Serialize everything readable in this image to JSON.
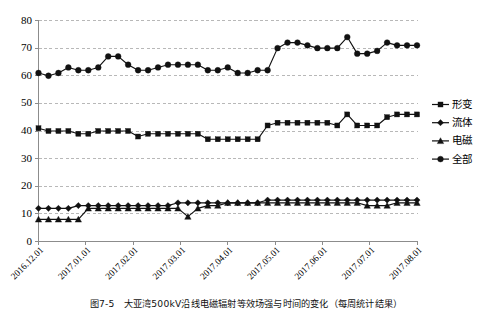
{
  "chart_data": {
    "type": "line",
    "title": "",
    "xlabel": "",
    "ylabel": "",
    "ylim": [
      0,
      80
    ],
    "ytick_step": 10,
    "yticks": [
      0,
      10,
      20,
      30,
      40,
      50,
      60,
      70,
      80
    ],
    "grid": true,
    "legend_position": "right",
    "x_tick_labels": [
      "2016.12.01",
      "2017.01.01",
      "2017.02.01",
      "2017.03.01",
      "2017.04.01",
      "2017.05.01",
      "2017.06.01",
      "2017.07.01",
      "2017.08.01"
    ],
    "n_points": 39,
    "series": [
      {
        "name": "形变",
        "marker": "square",
        "values": [
          41,
          40,
          40,
          40,
          39,
          39,
          40,
          40,
          40,
          40,
          38,
          39,
          39,
          39,
          39,
          39,
          39,
          37,
          37,
          37,
          37,
          37,
          37,
          42,
          43,
          43,
          43,
          43,
          43,
          43,
          42,
          46,
          42,
          42,
          42,
          45,
          46,
          46,
          46
        ]
      },
      {
        "name": "流体",
        "marker": "diamond",
        "values": [
          12,
          12,
          12,
          12,
          13,
          13,
          13,
          13,
          13,
          13,
          13,
          13,
          13,
          13,
          14,
          14,
          14,
          14,
          14,
          14,
          14,
          14,
          14,
          15,
          15,
          15,
          15,
          15,
          15,
          15,
          15,
          15,
          15,
          15,
          15,
          15,
          15,
          15,
          15
        ]
      },
      {
        "name": "电磁",
        "marker": "triangle",
        "values": [
          8,
          8,
          8,
          8,
          8,
          12,
          12,
          12,
          12,
          12,
          12,
          12,
          12,
          12,
          12,
          9,
          12,
          13,
          13,
          14,
          14,
          14,
          14,
          14,
          14,
          14,
          14,
          14,
          14,
          14,
          14,
          14,
          14,
          13,
          13,
          13,
          14,
          14,
          14
        ]
      },
      {
        "name": "全部",
        "marker": "circle",
        "values": [
          61,
          60,
          61,
          63,
          62,
          62,
          63,
          67,
          67,
          64,
          62,
          62,
          63,
          64,
          64,
          64,
          64,
          62,
          62,
          63,
          61,
          61,
          62,
          62,
          70,
          72,
          72,
          71,
          70,
          70,
          70,
          74,
          68,
          68,
          69,
          72,
          71,
          71,
          71
        ]
      }
    ]
  },
  "legend": {
    "items": [
      {
        "label": "形变",
        "marker": "square"
      },
      {
        "label": "流体",
        "marker": "diamond"
      },
      {
        "label": "电磁",
        "marker": "triangle"
      },
      {
        "label": "全部",
        "marker": "circle"
      }
    ]
  },
  "caption": {
    "text": "图7-5　大亚湾500kV沿线电磁辐射等效场强与时间的变化（每周统计结果）"
  }
}
